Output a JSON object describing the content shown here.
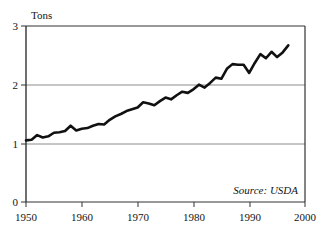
{
  "chart_data": {
    "type": "line",
    "title": "",
    "subtitle": "",
    "xlabel": "",
    "ylabel": "Tons",
    "ylabel_position": "top-left-above-axis",
    "xlim": [
      1950,
      2000
    ],
    "ylim": [
      0,
      3
    ],
    "yticks": [
      "0",
      "1",
      "2",
      "3"
    ],
    "ytick_values": [
      0,
      1,
      2,
      3
    ],
    "xticks": [
      "1950",
      "1960",
      "1970",
      "1980",
      "1990",
      "2000"
    ],
    "xtick_values": [
      1950,
      1960,
      1970,
      1980,
      1990,
      2000
    ],
    "gridlines": {
      "horizontal_at": [
        1,
        2
      ],
      "vertical": false,
      "color": "#8c8c8c"
    },
    "legend": null,
    "annotations": [
      {
        "name": "source-note",
        "text": "Source: USDA",
        "style": "italic",
        "position": "bottom-right-inside-plot"
      }
    ],
    "line_style": {
      "color": "#111111",
      "width": 2.6,
      "cap": "round",
      "join": "round"
    },
    "frame": {
      "color": "#333333",
      "width": 1,
      "sides": [
        "top",
        "right",
        "bottom",
        "left"
      ]
    },
    "x": [
      1950,
      1951,
      1952,
      1953,
      1954,
      1955,
      1956,
      1957,
      1958,
      1959,
      1960,
      1961,
      1962,
      1963,
      1964,
      1965,
      1966,
      1967,
      1968,
      1969,
      1970,
      1971,
      1972,
      1973,
      1974,
      1975,
      1976,
      1977,
      1978,
      1979,
      1980,
      1981,
      1982,
      1983,
      1984,
      1985,
      1986,
      1987,
      1988,
      1989,
      1990,
      1991,
      1992,
      1993,
      1994,
      1995,
      1996,
      1997
    ],
    "values": [
      1.05,
      1.06,
      1.14,
      1.1,
      1.12,
      1.18,
      1.19,
      1.21,
      1.3,
      1.22,
      1.25,
      1.26,
      1.3,
      1.33,
      1.32,
      1.4,
      1.46,
      1.5,
      1.55,
      1.58,
      1.61,
      1.7,
      1.68,
      1.65,
      1.72,
      1.78,
      1.75,
      1.82,
      1.88,
      1.86,
      1.92,
      2.0,
      1.95,
      2.03,
      2.12,
      2.1,
      2.27,
      2.35,
      2.34,
      2.34,
      2.2,
      2.37,
      2.52,
      2.45,
      2.56,
      2.47,
      2.55,
      2.67
    ]
  },
  "axis": {
    "y_label": "Tons",
    "y_tick_0": "0",
    "y_tick_1": "1",
    "y_tick_2": "2",
    "y_tick_3": "3",
    "x_tick_1950": "1950",
    "x_tick_1960": "1960",
    "x_tick_1970": "1970",
    "x_tick_1980": "1980",
    "x_tick_1990": "1990",
    "x_tick_2000": "2000"
  },
  "source": {
    "text": "Source: USDA"
  }
}
